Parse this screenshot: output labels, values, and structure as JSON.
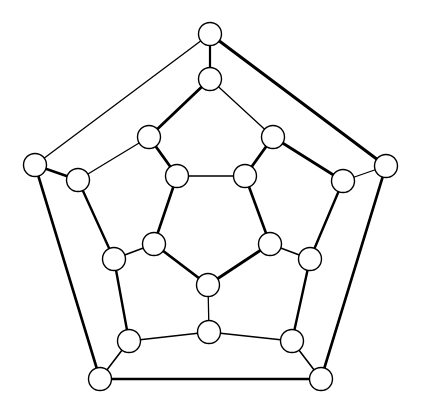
{
  "figure": {
    "kind": "graph-drawing",
    "name": "Dodecahedral graph",
    "width": 421,
    "height": 410,
    "background_color": "#ffffff",
    "node_count": 20,
    "edge_count": 30,
    "node_fill_color": "#ffffff",
    "node_stroke_color": "#000000",
    "node_radius": 11,
    "edge_color": "#000000"
  },
  "chart_data": {
    "type": "diagram",
    "title": "",
    "xlabel": "",
    "ylabel": "",
    "layout": "four concentric pentagonal rings (5 + 5 + 5 + 5 vertices)",
    "nodes": [
      {
        "id": "o1",
        "ring": "outer",
        "label": "",
        "x": 210,
        "y": 34,
        "r": 11.5
      },
      {
        "id": "o2",
        "ring": "outer",
        "label": "",
        "x": 386,
        "y": 166,
        "r": 11.5
      },
      {
        "id": "o3",
        "ring": "outer",
        "label": "",
        "x": 321,
        "y": 379,
        "r": 11.5
      },
      {
        "id": "o4",
        "ring": "outer",
        "label": "",
        "x": 100,
        "y": 379,
        "r": 11.5
      },
      {
        "id": "o5",
        "ring": "outer",
        "label": "",
        "x": 35,
        "y": 165,
        "r": 11.5
      },
      {
        "id": "m1",
        "ring": "middle-outer",
        "label": "",
        "x": 210,
        "y": 79,
        "r": 11.5
      },
      {
        "id": "m2",
        "ring": "middle-outer",
        "label": "",
        "x": 343,
        "y": 181,
        "r": 11.5
      },
      {
        "id": "m3",
        "ring": "middle-outer",
        "label": "",
        "x": 292,
        "y": 341,
        "r": 11.5
      },
      {
        "id": "m4",
        "ring": "middle-outer",
        "label": "",
        "x": 129,
        "y": 341,
        "r": 11.5
      },
      {
        "id": "m5",
        "ring": "middle-outer",
        "label": "",
        "x": 78,
        "y": 180,
        "r": 11.5
      },
      {
        "id": "n1",
        "ring": "middle-inner",
        "label": "",
        "x": 273,
        "y": 137,
        "r": 11.5
      },
      {
        "id": "n2",
        "ring": "middle-inner",
        "label": "",
        "x": 310,
        "y": 259,
        "r": 11.5
      },
      {
        "id": "n3",
        "ring": "middle-inner",
        "label": "",
        "x": 209,
        "y": 332,
        "r": 11.5
      },
      {
        "id": "n4",
        "ring": "middle-inner",
        "label": "",
        "x": 114,
        "y": 259,
        "r": 11.5
      },
      {
        "id": "n5",
        "ring": "middle-inner",
        "label": "",
        "x": 149,
        "y": 137,
        "r": 11.5
      },
      {
        "id": "i1",
        "ring": "inner",
        "label": "",
        "x": 245,
        "y": 176,
        "r": 11.5
      },
      {
        "id": "i2",
        "ring": "inner",
        "label": "",
        "x": 270,
        "y": 244,
        "r": 11.5
      },
      {
        "id": "i3",
        "ring": "inner",
        "label": "",
        "x": 208,
        "y": 285,
        "r": 11.5
      },
      {
        "id": "i4",
        "ring": "inner",
        "label": "",
        "x": 154,
        "y": 244,
        "r": 11.5
      },
      {
        "id": "i5",
        "ring": "inner",
        "label": "",
        "x": 177,
        "y": 176,
        "r": 11.5
      }
    ],
    "edges": [
      {
        "from": "o1",
        "to": "o2",
        "width": 3.0
      },
      {
        "from": "o2",
        "to": "o3",
        "width": 2.6
      },
      {
        "from": "o3",
        "to": "o4",
        "width": 2.6
      },
      {
        "from": "o4",
        "to": "o5",
        "width": 2.6
      },
      {
        "from": "o5",
        "to": "o1",
        "width": 1.3
      },
      {
        "from": "o1",
        "to": "m1",
        "width": 2.2
      },
      {
        "from": "o2",
        "to": "m2",
        "width": 1.3
      },
      {
        "from": "o3",
        "to": "m3",
        "width": 1.6
      },
      {
        "from": "o4",
        "to": "m4",
        "width": 1.6
      },
      {
        "from": "o5",
        "to": "m5",
        "width": 2.4
      },
      {
        "from": "m1",
        "to": "n5",
        "width": 2.8
      },
      {
        "from": "m1",
        "to": "n1",
        "width": 1.3
      },
      {
        "from": "m2",
        "to": "n1",
        "width": 2.8
      },
      {
        "from": "m2",
        "to": "n2",
        "width": 2.4
      },
      {
        "from": "m3",
        "to": "n2",
        "width": 2.4
      },
      {
        "from": "m3",
        "to": "n3",
        "width": 1.6
      },
      {
        "from": "m4",
        "to": "n3",
        "width": 1.6
      },
      {
        "from": "m4",
        "to": "n4",
        "width": 2.4
      },
      {
        "from": "m5",
        "to": "n4",
        "width": 2.4
      },
      {
        "from": "m5",
        "to": "n5",
        "width": 1.3
      },
      {
        "from": "n1",
        "to": "i1",
        "width": 2.8
      },
      {
        "from": "n2",
        "to": "i2",
        "width": 1.6
      },
      {
        "from": "n3",
        "to": "i3",
        "width": 1.3
      },
      {
        "from": "n4",
        "to": "i4",
        "width": 1.6
      },
      {
        "from": "n5",
        "to": "i5",
        "width": 2.8
      },
      {
        "from": "i1",
        "to": "i2",
        "width": 2.6
      },
      {
        "from": "i2",
        "to": "i3",
        "width": 2.8
      },
      {
        "from": "i3",
        "to": "i4",
        "width": 2.8
      },
      {
        "from": "i4",
        "to": "i5",
        "width": 2.6
      },
      {
        "from": "i5",
        "to": "i1",
        "width": 1.3
      }
    ]
  }
}
